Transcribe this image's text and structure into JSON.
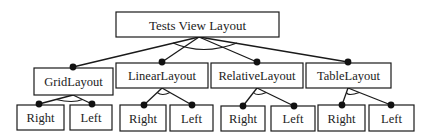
{
  "diagram": {
    "type": "feature-model-tree",
    "root": {
      "label": "Tests View Layout",
      "box": [
        116,
        12,
        163,
        25
      ],
      "apex": [
        199,
        37
      ],
      "group_arc": {
        "rx": 26,
        "bottom_y": 48
      }
    },
    "layouts": [
      {
        "label": "GridLayout",
        "box": [
          34,
          68,
          79,
          27
        ],
        "dot": [
          73,
          67
        ],
        "apex": [
          73,
          95
        ],
        "children": [
          {
            "label": "Right",
            "box": [
              17,
              105,
              47,
              25
            ],
            "dot": [
              39,
              104
            ]
          },
          {
            "label": "Left",
            "box": [
              70,
              105,
              42,
              25
            ],
            "dot": [
              92,
              104
            ]
          }
        ]
      },
      {
        "label": "LinearLayout",
        "box": [
          116,
          63,
          92,
          25
        ],
        "dot": [
          162,
          62
        ],
        "apex": [
          162,
          88
        ],
        "children": [
          {
            "label": "Right",
            "box": [
              120,
              105,
              46,
              26
            ],
            "dot": [
              144,
              105
            ]
          },
          {
            "label": "Left",
            "box": [
              170,
              105,
              43,
              26
            ],
            "dot": [
              192,
              105
            ]
          }
        ]
      },
      {
        "label": "RelativeLayout",
        "box": [
          211,
          63,
          92,
          25
        ],
        "dot": [
          257,
          62
        ],
        "apex": [
          257,
          88
        ],
        "children": [
          {
            "label": "Right",
            "box": [
              221,
              106,
              44,
              25
            ],
            "dot": [
              243,
              106
            ]
          },
          {
            "label": "Left",
            "box": [
              271,
              106,
              44,
              25
            ],
            "dot": [
              294,
              106
            ]
          }
        ]
      },
      {
        "label": "TableLayout",
        "box": [
          306,
          63,
          85,
          25
        ],
        "dot": [
          348,
          62
        ],
        "apex": [
          348,
          88
        ],
        "children": [
          {
            "label": "Right",
            "box": [
              318,
              105,
              47,
              26
            ],
            "dot": [
              342,
              105
            ]
          },
          {
            "label": "Left",
            "box": [
              369,
              105,
              45,
              26
            ],
            "dot": [
              391,
              105
            ]
          }
        ]
      }
    ],
    "colors": {
      "stroke": "#1a1a1a",
      "dot": "#111111",
      "text": "#222222",
      "background": "#ffffff"
    }
  }
}
